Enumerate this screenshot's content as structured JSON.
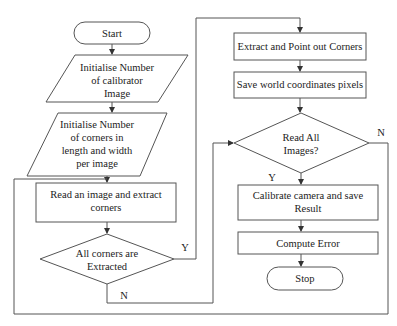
{
  "diagram": {
    "type": "flowchart",
    "colors": {
      "stroke": "#555555",
      "text": "#222222",
      "background": "#ffffff"
    },
    "nodes": {
      "start": {
        "shape": "terminal",
        "lines": [
          "Start"
        ]
      },
      "init_images": {
        "shape": "parallelogram",
        "lines": [
          "Initialise Number",
          "of calibrator",
          "Image"
        ]
      },
      "init_corners": {
        "shape": "parallelogram",
        "lines": [
          "Initialise Number",
          "of corners in",
          "length and width",
          "per image"
        ]
      },
      "read_image": {
        "shape": "process",
        "lines": [
          "Read an image and extract",
          "corners"
        ]
      },
      "all_corners": {
        "shape": "decision",
        "lines": [
          "All corners are",
          "Extracted"
        ]
      },
      "extract_corners": {
        "shape": "process",
        "lines": [
          "Extract and Point out Corners"
        ]
      },
      "save_world": {
        "shape": "process",
        "lines": [
          "Save world coordinates pixels"
        ]
      },
      "read_all": {
        "shape": "decision",
        "lines": [
          "Read All",
          "Images?"
        ]
      },
      "calibrate": {
        "shape": "process",
        "lines": [
          "Calibrate camera and save",
          "Result"
        ]
      },
      "compute_error": {
        "shape": "process",
        "lines": [
          "Compute Error"
        ]
      },
      "stop": {
        "shape": "terminal",
        "lines": [
          "Stop"
        ]
      }
    },
    "edge_labels": {
      "all_corners_yes": "Y",
      "all_corners_no": "N",
      "read_all_yes": "Y",
      "read_all_no": "N"
    },
    "edges": [
      {
        "from": "start",
        "to": "init_images"
      },
      {
        "from": "init_images",
        "to": "init_corners"
      },
      {
        "from": "init_corners",
        "to": "read_image"
      },
      {
        "from": "read_image",
        "to": "all_corners"
      },
      {
        "from": "all_corners",
        "to": "extract_corners",
        "label": "Y"
      },
      {
        "from": "all_corners",
        "to": "read_all",
        "label": "N"
      },
      {
        "from": "extract_corners",
        "to": "save_world"
      },
      {
        "from": "save_world",
        "to": "read_all"
      },
      {
        "from": "read_all",
        "to": "calibrate",
        "label": "Y"
      },
      {
        "from": "read_all",
        "to": "read_image",
        "label": "N"
      },
      {
        "from": "calibrate",
        "to": "compute_error"
      },
      {
        "from": "compute_error",
        "to": "stop"
      }
    ]
  }
}
